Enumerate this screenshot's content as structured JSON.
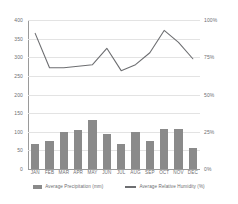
{
  "chart_data": {
    "type": "bar",
    "title": "",
    "subtitle": "",
    "xlabel": "",
    "ylabel": "",
    "y2label": "",
    "grid": true,
    "legend_position": "bottom",
    "categories": [
      "JAN",
      "FEB",
      "MAR",
      "APR",
      "MAY",
      "JUN",
      "JUL",
      "AUG",
      "SEP",
      "OCT",
      "NOV",
      "DEC"
    ],
    "ylim": [
      0,
      400
    ],
    "yticks": [
      0,
      50,
      100,
      150,
      200,
      250,
      300,
      350,
      400
    ],
    "ytick_labels": [
      "0",
      "50",
      "100",
      "150",
      "200",
      "250",
      "300",
      "350",
      "400"
    ],
    "y2lim": [
      0,
      100
    ],
    "y2ticks": [
      0,
      25,
      50,
      75,
      100
    ],
    "y2tick_labels": [
      "0%",
      "25%",
      "50%",
      "75%",
      "100%"
    ],
    "series": [
      {
        "name": "Average Precipitation (mm)",
        "type": "bar",
        "axis": "left",
        "color": "#8a8a8a",
        "values": [
          67,
          76,
          99,
          106,
          131,
          94,
          67,
          99,
          75,
          108,
          107,
          56
        ]
      },
      {
        "name": "Average Relative Humidity (%)",
        "type": "line",
        "axis": "right",
        "color": "#6d6e71",
        "values": [
          91,
          68,
          68,
          69,
          70,
          81,
          66,
          70,
          78,
          93,
          85,
          74
        ]
      }
    ]
  },
  "legend": {
    "items": [
      {
        "label": "Average Precipitation (mm)",
        "swatch": "bar-swatch"
      },
      {
        "label": "Average Relative Humidity (%)",
        "swatch": "line-swatch"
      }
    ]
  }
}
